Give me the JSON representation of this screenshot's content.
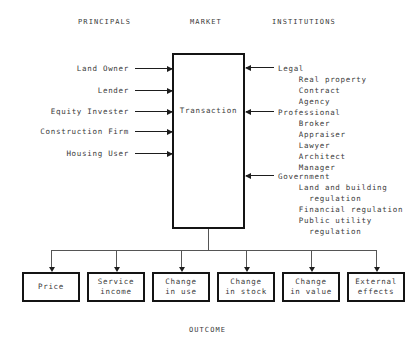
{
  "headers": {
    "principals": "PRINCIPALS",
    "market": "MARKET",
    "institutions": "INSTITUTIONS"
  },
  "center": {
    "label": "Transaction"
  },
  "principals": [
    {
      "label": "Land Owner",
      "y": 64
    },
    {
      "label": "Lender",
      "y": 86
    },
    {
      "label": "Equity Invester",
      "y": 107
    },
    {
      "label": "Construction Firm",
      "y": 127
    },
    {
      "label": "Housing User",
      "y": 149
    }
  ],
  "institutions": [
    {
      "group": "Legal",
      "arrow_y": 67,
      "text": "Legal\n    Real property\n    Contract\n    Agency"
    },
    {
      "group": "Professional",
      "arrow_y": 111,
      "text": "Professional\n    Broker\n    Appraiser\n    Lawyer\n    Architect\n    Manager"
    },
    {
      "group": "Government",
      "arrow_y": 175,
      "text": "Government\n    Land and building\n      regulation\n    Financial regulation\n    Public utility\n      regulation"
    }
  ],
  "outcomes": [
    {
      "label": "Price",
      "x": 22
    },
    {
      "label": "Service\nincome",
      "x": 87
    },
    {
      "label": "Change\nin use",
      "x": 152
    },
    {
      "label": "Change\nin stock",
      "x": 217
    },
    {
      "label": "Change\nin value",
      "x": 282
    },
    {
      "label": "External\neffects",
      "x": 347
    }
  ],
  "outcome_caption": "OUTCOME",
  "colors": {
    "box_border": "#141414",
    "connector": "#1d1d1d",
    "thin_line": "#555555",
    "text": "#3a3a3a",
    "background": "#ffffff"
  }
}
